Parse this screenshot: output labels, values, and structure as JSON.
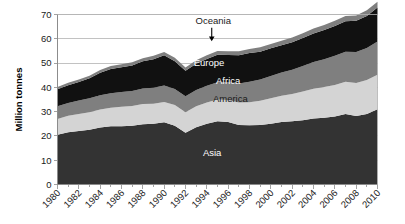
{
  "chart_data": {
    "type": "area",
    "stacked": true,
    "title": "",
    "subtitle": "",
    "xlabel": "",
    "ylabel": "Million tonnes",
    "ylim": [
      0,
      70
    ],
    "ytick_step": 10,
    "yticks": [
      0,
      10,
      20,
      30,
      40,
      50,
      60,
      70
    ],
    "xlim": [
      1980,
      2010
    ],
    "grid": true,
    "grid_axis": "y",
    "legend_position": "inline-annotations",
    "x": [
      1980,
      1981,
      1982,
      1983,
      1984,
      1985,
      1986,
      1987,
      1988,
      1989,
      1990,
      1991,
      1992,
      1993,
      1994,
      1995,
      1996,
      1997,
      1998,
      1999,
      2000,
      2001,
      2002,
      2003,
      2004,
      2005,
      2006,
      2007,
      2008,
      2009,
      2010
    ],
    "xtick_labels": [
      "1980",
      "1982",
      "1984",
      "1986",
      "1988",
      "1990",
      "1992",
      "1994",
      "1996",
      "1998",
      "2000",
      "2002",
      "2004",
      "2006",
      "2008",
      "2010"
    ],
    "xtick_label_rotation": -45,
    "series": [
      {
        "name": "Asia",
        "color": "#333333",
        "label_color": "#ffffff",
        "values": [
          20.5,
          21.5,
          22.0,
          22.5,
          23.5,
          24.0,
          24.0,
          24.2,
          24.8,
          25.0,
          25.6,
          24.2,
          21.3,
          23.6,
          25.0,
          26.0,
          25.7,
          24.5,
          24.4,
          24.5,
          25.0,
          25.7,
          26.0,
          26.5,
          27.2,
          27.5,
          28.0,
          29.0,
          28.2,
          29.0,
          31.0
        ]
      },
      {
        "name": "America",
        "color": "#d4d4d4",
        "label_color": "#1a1a1a",
        "values": [
          6.5,
          6.8,
          7.0,
          7.2,
          7.4,
          7.6,
          8.0,
          8.1,
          8.3,
          8.3,
          8.4,
          8.5,
          8.5,
          8.6,
          8.8,
          9.0,
          9.1,
          9.3,
          9.5,
          10.0,
          10.5,
          10.8,
          11.3,
          11.8,
          12.2,
          12.6,
          13.0,
          13.3,
          13.6,
          14.0,
          14.2
        ]
      },
      {
        "name": "Africa",
        "color": "#7f7f7f",
        "label_color": "#ffffff",
        "values": [
          5.2,
          5.3,
          5.6,
          5.8,
          5.9,
          6.0,
          6.1,
          6.2,
          6.4,
          6.5,
          6.8,
          6.6,
          6.5,
          6.7,
          6.9,
          7.1,
          7.3,
          7.8,
          8.4,
          8.7,
          9.2,
          9.6,
          10.0,
          10.5,
          11.0,
          11.5,
          12.0,
          12.4,
          12.8,
          13.2,
          13.7
        ]
      },
      {
        "name": "Europe",
        "color": "#111111",
        "label_color": "#ffffff",
        "values": [
          7.0,
          7.3,
          7.6,
          8.2,
          9.2,
          10.0,
          10.2,
          10.5,
          11.2,
          11.8,
          12.4,
          11.5,
          10.5,
          10.8,
          11.0,
          11.3,
          11.2,
          11.6,
          11.8,
          11.5,
          11.4,
          11.2,
          11.3,
          11.5,
          11.8,
          12.0,
          12.3,
          12.5,
          12.8,
          13.2,
          14.0
        ]
      },
      {
        "name": "Oceania",
        "color": "#7f7f7f",
        "label_color": "#1a1a1a",
        "values": [
          0.9,
          1.0,
          1.0,
          1.1,
          1.1,
          1.2,
          1.2,
          1.3,
          1.3,
          1.4,
          1.4,
          1.4,
          1.4,
          1.5,
          1.5,
          1.6,
          1.6,
          1.7,
          1.7,
          1.8,
          1.8,
          1.9,
          1.9,
          2.0,
          2.0,
          2.1,
          2.1,
          2.2,
          2.2,
          2.3,
          2.4
        ]
      }
    ],
    "annotations": [
      {
        "text": "Oceania",
        "type": "callout-arrow",
        "target_series": "Oceania",
        "x_label": 1994.6,
        "y_label": 66.0
      },
      {
        "text": "Europe",
        "type": "inline",
        "series": "Europe",
        "x_label": 1994.2,
        "y_label": 48.6
      },
      {
        "text": "Africa",
        "type": "inline",
        "series": "Africa",
        "x_label": 1996.0,
        "y_label": 41.2
      },
      {
        "text": "America",
        "type": "inline",
        "series": "America",
        "x_label": 1996.2,
        "y_label": 33.8
      },
      {
        "text": "Asia",
        "type": "inline",
        "series": "Asia",
        "x_label": 1994.5,
        "y_label": 11.6
      }
    ]
  },
  "colors": {
    "background": "#ffffff",
    "axis": "#8c8c8c",
    "grid": "#b3b3b3",
    "text": "#1a1a1a",
    "asia": "#333333",
    "america": "#d4d4d4",
    "africa": "#7f7f7f",
    "europe": "#111111",
    "oceania": "#7f7f7f"
  }
}
